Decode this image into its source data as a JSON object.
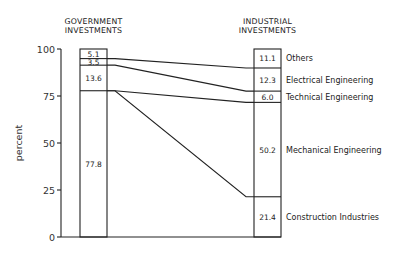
{
  "chart_data": {
    "type": "bar",
    "subtype": "stacked-100-percent-with-connectors",
    "title": "",
    "ylabel": "percent",
    "xlabel": "",
    "ylim": [
      0,
      100
    ],
    "yticks": [
      "0",
      "25",
      "50",
      "75",
      "100"
    ],
    "grid": false,
    "categories": [
      "GOVERNMENT INVESTMENTS",
      "INDUSTRIAL INVESTMENTS"
    ],
    "category_lines": [
      [
        "GOVERNMENT",
        "INVESTMENTS"
      ],
      [
        "INDUSTRIAL",
        "INVESTMENTS"
      ]
    ],
    "series": [
      {
        "name": "Construction Industries",
        "values": [
          0,
          21.4
        ]
      },
      {
        "name": "Mechanical Engineering",
        "values": [
          77.8,
          50.2
        ]
      },
      {
        "name": "Technical Engineering",
        "values": [
          13.6,
          6.0
        ]
      },
      {
        "name": "Electrical Engineering",
        "values": [
          3.5,
          12.3
        ]
      },
      {
        "name": "Others",
        "values": [
          5.1,
          11.1
        ]
      }
    ],
    "bar_labels": {
      "government": [
        "77.8",
        "13.6",
        "3.5",
        "5.1"
      ],
      "industrial": [
        "21.4",
        "50.2",
        "6.0",
        "12.3",
        "11.1"
      ]
    },
    "legend": [
      "Others",
      "Electrical Engineering",
      "Technical Engineering",
      "Mechanical Engineering",
      "Construction Industries"
    ],
    "legend_position": "right of industrial bar"
  }
}
